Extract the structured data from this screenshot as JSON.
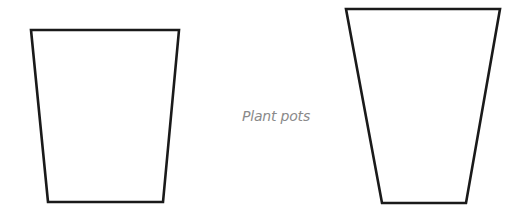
{
  "diagram": {
    "caption": "Plant pots",
    "caption_color": "#8a8a8a",
    "stroke_color": "#1a1a1a",
    "background": "#ffffff",
    "shapes": [
      {
        "name": "left-pot",
        "type": "trapezoid",
        "points": "31,30 179,30 163,202 48,202"
      },
      {
        "name": "right-pot",
        "type": "trapezoid",
        "points": "346,9 500,9 466,203 382,203"
      }
    ]
  }
}
